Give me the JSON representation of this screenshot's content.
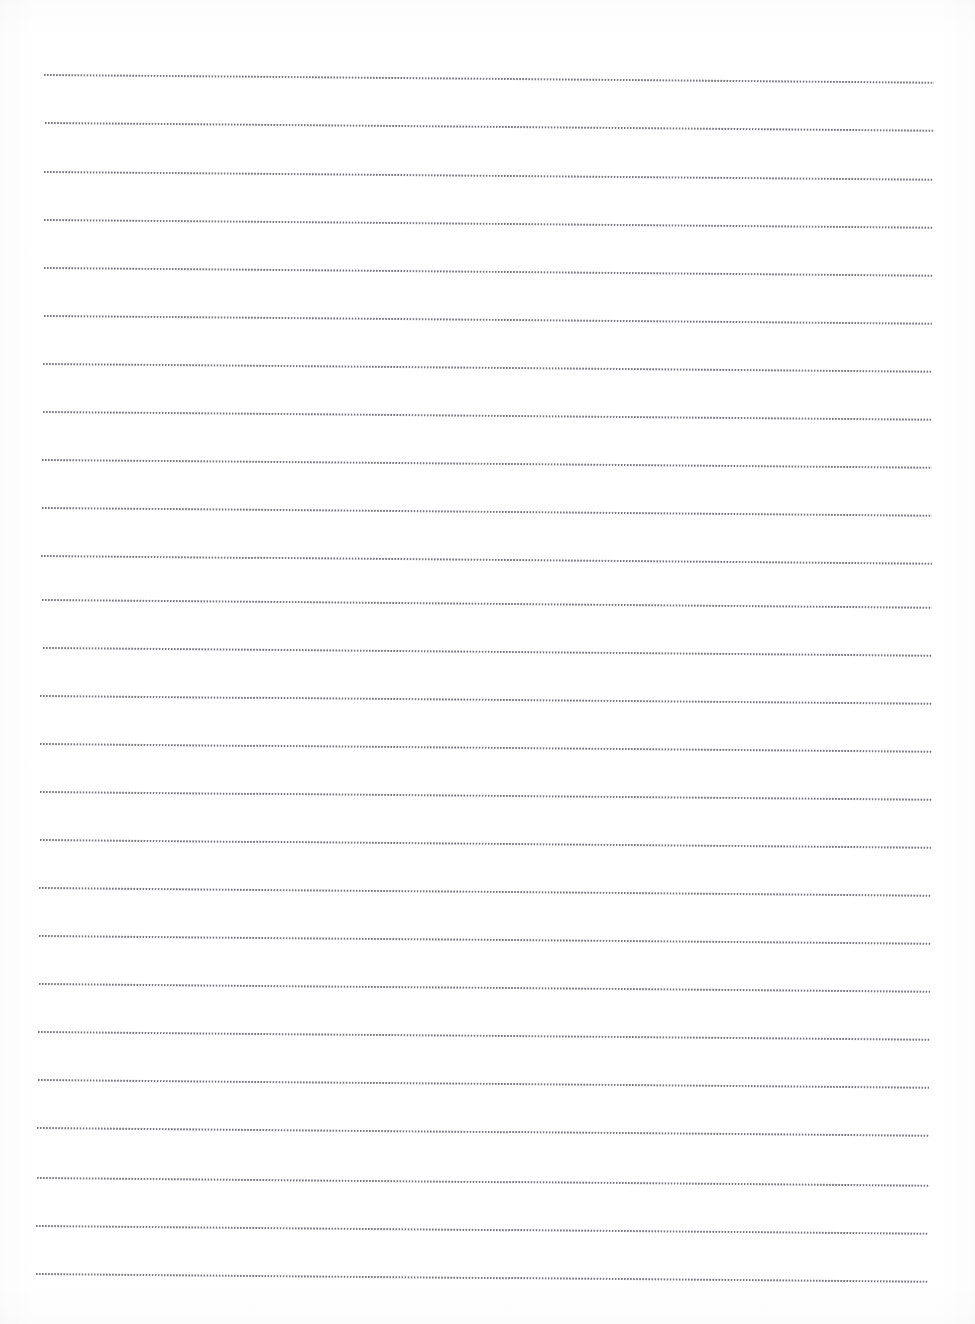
{
  "document": {
    "kind": "dotted-ruled-writing-paper",
    "title": "",
    "page_width": 975,
    "page_height": 1324,
    "background_color": "#ffffff",
    "rule_color": "#76767d",
    "orientation": "portrait",
    "visible_text": "",
    "handwriting_present": "no"
  },
  "ruling": {
    "style": "dotted",
    "line_count": 26,
    "first_line_y": 75,
    "line_spacing": 48.3,
    "left_x": 43,
    "right_x": 932,
    "line_thickness": 2,
    "dot_pitch": 3.05,
    "dot_size": 1.7,
    "skew_degrees": 0.5,
    "left_margin_rule": "none",
    "lines": [
      {
        "index": 1,
        "y": 75,
        "x_start": 44,
        "x_end": 934
      },
      {
        "index": 2,
        "y": 123,
        "x_start": 45,
        "x_end": 934
      },
      {
        "index": 3,
        "y": 172,
        "x_start": 44,
        "x_end": 933
      },
      {
        "index": 4,
        "y": 220,
        "x_start": 44,
        "x_end": 933
      },
      {
        "index": 5,
        "y": 268,
        "x_start": 44,
        "x_end": 933
      },
      {
        "index": 6,
        "y": 316,
        "x_start": 44,
        "x_end": 932
      },
      {
        "index": 7,
        "y": 364,
        "x_start": 43,
        "x_end": 932
      },
      {
        "index": 8,
        "y": 412,
        "x_start": 43,
        "x_end": 932
      },
      {
        "index": 9,
        "y": 460,
        "x_start": 42,
        "x_end": 932
      },
      {
        "index": 10,
        "y": 508,
        "x_start": 42,
        "x_end": 932
      },
      {
        "index": 11,
        "y": 556,
        "x_start": 41,
        "x_end": 932
      },
      {
        "index": 12,
        "y": 600,
        "x_start": 42,
        "x_end": 932
      },
      {
        "index": 13,
        "y": 648,
        "x_start": 43,
        "x_end": 932
      },
      {
        "index": 14,
        "y": 696,
        "x_start": 40,
        "x_end": 932
      },
      {
        "index": 15,
        "y": 744,
        "x_start": 40,
        "x_end": 932
      },
      {
        "index": 16,
        "y": 792,
        "x_start": 40,
        "x_end": 932
      },
      {
        "index": 17,
        "y": 840,
        "x_start": 40,
        "x_end": 931
      },
      {
        "index": 18,
        "y": 888,
        "x_start": 39,
        "x_end": 931
      },
      {
        "index": 19,
        "y": 936,
        "x_start": 39,
        "x_end": 931
      },
      {
        "index": 20,
        "y": 984,
        "x_start": 39,
        "x_end": 930
      },
      {
        "index": 21,
        "y": 1032,
        "x_start": 38,
        "x_end": 930
      },
      {
        "index": 22,
        "y": 1080,
        "x_start": 38,
        "x_end": 929
      },
      {
        "index": 23,
        "y": 1128,
        "x_start": 37,
        "x_end": 929
      },
      {
        "index": 24,
        "y": 1178,
        "x_start": 37,
        "x_end": 929
      },
      {
        "index": 25,
        "y": 1226,
        "x_start": 36,
        "x_end": 928
      },
      {
        "index": 26,
        "y": 1274,
        "x_start": 36,
        "x_end": 928
      }
    ]
  }
}
